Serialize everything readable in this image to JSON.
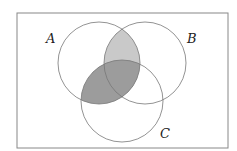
{
  "diagram": {
    "type": "venn",
    "sets": [
      {
        "name": "A",
        "cx": 99,
        "cy": 63,
        "r": 41,
        "label_x": 50,
        "label_y": 42
      },
      {
        "name": "B",
        "cx": 145,
        "cy": 63,
        "r": 41,
        "label_x": 190,
        "label_y": 42
      },
      {
        "name": "C",
        "cx": 122,
        "cy": 101,
        "r": 41,
        "label_x": 163,
        "label_y": 137
      }
    ],
    "shaded_regions": [
      {
        "region": "A∩B",
        "color": "#c9c9c9"
      },
      {
        "region": "A∩C",
        "color": "#9c9c9c"
      }
    ],
    "universe": {
      "x": 17,
      "y": 13,
      "width": 211,
      "height": 135
    }
  }
}
